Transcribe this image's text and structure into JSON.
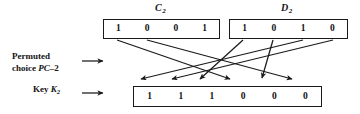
{
  "diagram": {
    "title_c2": "C",
    "title_c2_sub": "2",
    "title_d2": "D",
    "title_d2_sub": "2",
    "boxes": {
      "c2": {
        "name": "C2",
        "bits": [
          "1",
          "0",
          "0",
          "1"
        ]
      },
      "d2": {
        "name": "D2",
        "bits": [
          "1",
          "0",
          "1",
          "0"
        ]
      },
      "k2": {
        "name": "K2",
        "bits": [
          "1",
          "1",
          "1",
          "0",
          "0",
          "0"
        ]
      }
    },
    "labels": {
      "pc2_line1": "Permuted",
      "pc2_line2_prefix": "choice ",
      "pc2_line2_italic": "PC",
      "pc2_line2_suffix": "–2",
      "key_prefix": "Key ",
      "key_italic": "K",
      "key_sub": "2"
    },
    "arrow_glyph": "⟶",
    "colors": {
      "stroke": "#1a1a1a",
      "background": "#ffffff",
      "text": "#111111"
    },
    "wires": [
      {
        "from": "c2-bit-1",
        "to": "k2-bit-4"
      },
      {
        "from": "c2-bit-2",
        "to": "k2-bit-6"
      },
      {
        "from": "d2-bit-1",
        "to": "k2-bit-3"
      },
      {
        "from": "d2-bit-2",
        "to": "k2-bit-5"
      },
      {
        "from": "d2-bit-3",
        "to": "k2-bit-1"
      },
      {
        "from": "d2-bit-4",
        "to": "k2-bit-2"
      }
    ]
  }
}
